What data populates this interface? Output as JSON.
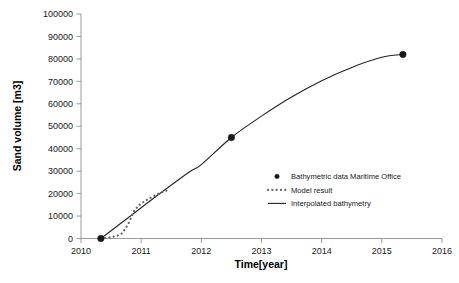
{
  "chart_data": {
    "type": "line",
    "title": "",
    "xlabel": "Time[year]",
    "ylabel": "Sand volume [m3]",
    "xlim": [
      2010,
      2016
    ],
    "ylim": [
      0,
      100000
    ],
    "xticks": [
      2010,
      2011,
      2012,
      2013,
      2014,
      2015,
      2016
    ],
    "xtick_labels": [
      "2010",
      "2011",
      "2012",
      "2013",
      "2014",
      "2015",
      "2016"
    ],
    "yticks": [
      0,
      10000,
      20000,
      30000,
      40000,
      50000,
      60000,
      70000,
      80000,
      90000,
      100000
    ],
    "ytick_labels": [
      "0",
      "10000",
      "20000",
      "30000",
      "40000",
      "50000",
      "60000",
      "70000",
      "80000",
      "90000",
      "100000"
    ],
    "grid": false,
    "legend_position": "center-right",
    "series": [
      {
        "name": "Bathymetric data Maritime Office",
        "style": "marker",
        "marker": "circle",
        "color": "#1a1a1a",
        "x": [
          2010.33,
          2012.5,
          2015.35
        ],
        "values": [
          0,
          45000,
          82000
        ]
      },
      {
        "name": "Model result",
        "style": "dotted",
        "color": "#666666",
        "x": [
          2010.33,
          2010.45,
          2010.55,
          2010.62,
          2010.68,
          2010.73,
          2010.78,
          2010.83,
          2010.88,
          2010.93,
          2010.98,
          2011.04,
          2011.1,
          2011.17,
          2011.24,
          2011.31,
          2011.38,
          2011.44
        ],
        "values": [
          0,
          400,
          900,
          1400,
          2300,
          4200,
          6300,
          9200,
          12200,
          13800,
          15200,
          16300,
          17300,
          18300,
          19300,
          20200,
          20900,
          21500
        ]
      },
      {
        "name": "Interpolated bathymetry",
        "style": "line",
        "color": "#222222",
        "x": [
          2010.33,
          2010.8,
          2011.3,
          2011.8,
          2012.0,
          2012.5,
          2013.0,
          2013.5,
          2014.0,
          2014.5,
          2015.0,
          2015.35
        ],
        "values": [
          0,
          9600,
          19800,
          29600,
          32900,
          45000,
          54500,
          63000,
          70300,
          76200,
          80700,
          82000
        ]
      }
    ]
  },
  "legend": {
    "items": [
      {
        "label": "Bathymetric data Maritime Office",
        "marker": "dot"
      },
      {
        "label": "Model result",
        "marker": "dotted-line"
      },
      {
        "label": "Interpolated bathymetry",
        "marker": "solid-line"
      }
    ]
  },
  "axis": {
    "x_title": "Time[year]",
    "y_title": "Sand volume [m3]"
  }
}
